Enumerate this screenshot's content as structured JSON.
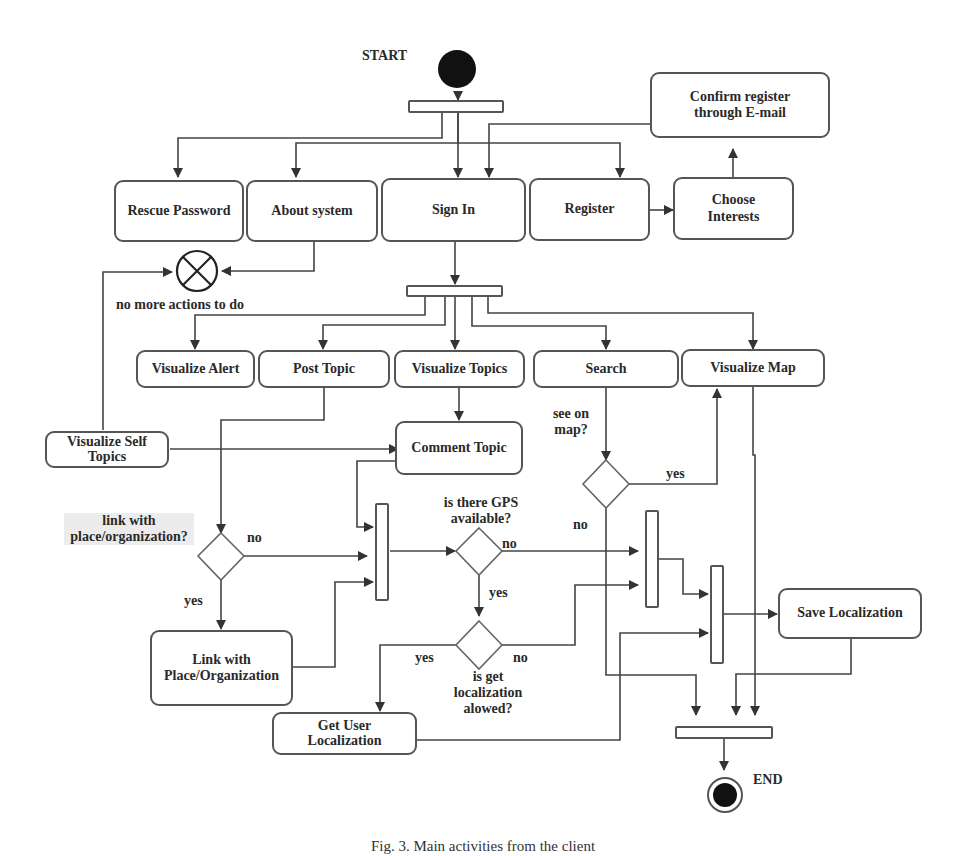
{
  "diagram": {
    "type": "UML activity diagram",
    "start_label": "START",
    "end_label": "END",
    "nodes": {
      "rescue_password": "Rescue Password",
      "about_system": "About system",
      "sign_in": "Sign In",
      "register": "Register",
      "choose_interests": "Choose Interests",
      "confirm_register": "Confirm register through E-mail",
      "visualize_alert": "Visualize Alert",
      "post_topic": "Post Topic",
      "visualize_topics": "Visualize Topics",
      "search": "Search",
      "visualize_map": "Visualize Map",
      "visualize_self_topics": "Visualize Self Topics",
      "comment_topic": "Comment Topic",
      "link_with_place": "Link with Place/Organization",
      "get_user_localization": "Get User Localization",
      "save_localization": "Save Localization"
    },
    "decisions": {
      "link_with_place": "link with place/organization?",
      "see_on_map": "see on map?",
      "gps_available": "is there GPS available?",
      "localization_allowed": "is get localization alowed?"
    },
    "guards": {
      "yes": "yes",
      "no": "no"
    },
    "flow_final_label": "no more actions to do",
    "caption": "Fig. 3. Main activities from the client"
  }
}
